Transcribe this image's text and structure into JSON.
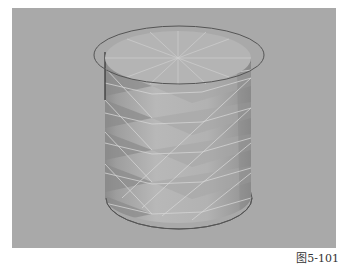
{
  "figure": {
    "caption": "图5-101",
    "colors": {
      "viewport_bg": "#a9a9a9",
      "body_light": "#b9b9b9",
      "body_mid": "#a2a2a2",
      "body_dark": "#7c7c7c",
      "cap": "#b3b3b3",
      "wire": "#d8d8d8",
      "ring": "#555555"
    }
  }
}
